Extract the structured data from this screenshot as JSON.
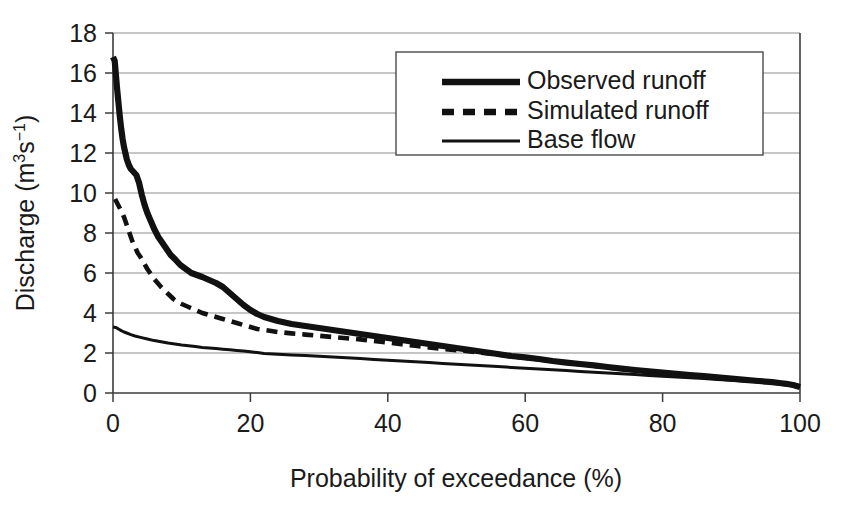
{
  "chart_data": {
    "type": "line",
    "title": "",
    "xlabel": "Probability of exceedance (%)",
    "ylabel_text": "Discharge (m",
    "ylabel_sup1": "3",
    "ylabel_mid": "s",
    "ylabel_sup2": "−1",
    "ylabel_end": ")",
    "ylabel_plain": "Discharge (m3s-1)",
    "xlim": [
      0,
      100
    ],
    "ylim": [
      0,
      18
    ],
    "xticks": [
      0,
      20,
      40,
      60,
      80,
      100
    ],
    "yticks": [
      0,
      2,
      4,
      6,
      8,
      10,
      12,
      14,
      16,
      18
    ],
    "xtick_labels": [
      "0",
      "20",
      "40",
      "60",
      "80",
      "100"
    ],
    "ytick_labels": [
      "0",
      "2",
      "4",
      "6",
      "8",
      "10",
      "12",
      "14",
      "16",
      "18"
    ],
    "grid": "horizontal",
    "legend_position": "top-right",
    "series": [
      {
        "name": "Observed runoff",
        "style": "thick-solid",
        "color": "#111111",
        "x": [
          0.0,
          0.25,
          0.4,
          0.6,
          0.8,
          1.0,
          1.2,
          1.4,
          1.6,
          1.8,
          2.0,
          2.3,
          2.6,
          3.0,
          3.4,
          3.8,
          4.2,
          4.6,
          5.0,
          5.5,
          6.0,
          6.6,
          7.2,
          7.8,
          8.4,
          9.0,
          9.8,
          10.6,
          11.4,
          12.2,
          13.0,
          14.0,
          15.0,
          16.0,
          17.0,
          18.0,
          19.0,
          20.0,
          21.0,
          22.0,
          24.0,
          26.0,
          28.0,
          30.0,
          32.0,
          34.0,
          36.0,
          38.0,
          40.0,
          42.0,
          44.0,
          46.0,
          48.0,
          50.0,
          52.0,
          54.0,
          56.0,
          58.0,
          60.0,
          62.0,
          64.0,
          66.0,
          68.0,
          70.0,
          72.0,
          74.0,
          76.0,
          78.0,
          80.0,
          82.0,
          84.0,
          86.0,
          88.0,
          90.0,
          92.0,
          94.0,
          96.0,
          97.0,
          98.0,
          99.0,
          99.5,
          100.0
        ],
        "y": [
          16.8,
          16.6,
          16.0,
          15.2,
          14.5,
          13.8,
          13.2,
          12.7,
          12.3,
          12.0,
          11.7,
          11.4,
          11.2,
          11.05,
          10.9,
          10.5,
          9.9,
          9.4,
          9.0,
          8.6,
          8.2,
          7.8,
          7.5,
          7.2,
          6.9,
          6.7,
          6.4,
          6.2,
          6.0,
          5.9,
          5.8,
          5.65,
          5.5,
          5.3,
          5.0,
          4.7,
          4.4,
          4.15,
          3.95,
          3.8,
          3.6,
          3.45,
          3.35,
          3.25,
          3.15,
          3.05,
          2.95,
          2.85,
          2.75,
          2.65,
          2.55,
          2.45,
          2.35,
          2.25,
          2.15,
          2.05,
          1.95,
          1.85,
          1.78,
          1.7,
          1.6,
          1.52,
          1.45,
          1.38,
          1.3,
          1.22,
          1.15,
          1.08,
          1.02,
          0.96,
          0.9,
          0.84,
          0.78,
          0.72,
          0.66,
          0.6,
          0.54,
          0.5,
          0.46,
          0.4,
          0.35,
          0.3
        ]
      },
      {
        "name": "Simulated runoff",
        "style": "dashed",
        "color": "#111111",
        "x": [
          0.3,
          0.6,
          0.9,
          1.2,
          1.6,
          2.0,
          2.4,
          2.8,
          3.2,
          3.6,
          4.0,
          4.5,
          5.0,
          5.5,
          6.0,
          6.5,
          7.0,
          7.6,
          8.2,
          8.8,
          9.4,
          10.0,
          11.0,
          12.0,
          13.0,
          14.0,
          15.0,
          16.0,
          17.0,
          18.0,
          19.0,
          20.0,
          21.0,
          22.0,
          24.0,
          26.0,
          28.0,
          30.0,
          32.0,
          34.0,
          36.0,
          38.0,
          40.0,
          42.0,
          44.0,
          46.0,
          48.0,
          50.0,
          52.0,
          54.0,
          56.0,
          58.0,
          60.0,
          62.0,
          64.0,
          66.0,
          68.0,
          70.0,
          72.0,
          74.0,
          76.0,
          78.0,
          80.0,
          82.0,
          84.0,
          86.0,
          88.0,
          90.0,
          92.0,
          94.0,
          96.0,
          97.0,
          98.0,
          99.0,
          99.5,
          100.0
        ],
        "y": [
          9.7,
          9.5,
          9.3,
          9.1,
          8.8,
          8.4,
          8.0,
          7.6,
          7.3,
          7.0,
          6.8,
          6.5,
          6.2,
          5.95,
          5.7,
          5.5,
          5.3,
          5.1,
          4.9,
          4.7,
          4.55,
          4.45,
          4.3,
          4.15,
          4.0,
          3.9,
          3.8,
          3.7,
          3.6,
          3.5,
          3.4,
          3.3,
          3.2,
          3.15,
          3.05,
          2.98,
          2.92,
          2.86,
          2.8,
          2.74,
          2.68,
          2.6,
          2.52,
          2.44,
          2.36,
          2.28,
          2.2,
          2.14,
          2.08,
          2.0,
          1.92,
          1.84,
          1.76,
          1.68,
          1.6,
          1.52,
          1.44,
          1.36,
          1.28,
          1.2,
          1.13,
          1.07,
          1.01,
          0.95,
          0.89,
          0.83,
          0.77,
          0.71,
          0.65,
          0.59,
          0.53,
          0.49,
          0.45,
          0.39,
          0.34,
          0.3
        ]
      },
      {
        "name": "Base flow",
        "style": "thin-solid",
        "color": "#111111",
        "x": [
          0.0,
          0.4,
          0.8,
          1.2,
          1.6,
          2.0,
          2.6,
          3.2,
          4.0,
          5.0,
          6.0,
          7.0,
          8.0,
          9.0,
          10.0,
          11.0,
          12.0,
          13.0,
          14.0,
          15.0,
          16.0,
          17.0,
          18.0,
          19.0,
          20.0,
          21.0,
          22.0,
          24.0,
          26.0,
          28.0,
          30.0,
          32.0,
          34.0,
          36.0,
          38.0,
          40.0,
          42.0,
          44.0,
          46.0,
          48.0,
          50.0,
          52.0,
          54.0,
          56.0,
          58.0,
          60.0,
          62.0,
          64.0,
          66.0,
          68.0,
          70.0,
          72.0,
          74.0,
          76.0,
          78.0,
          80.0,
          82.0,
          84.0,
          86.0,
          88.0,
          90.0,
          92.0,
          94.0,
          96.0,
          97.0,
          98.0,
          99.0,
          99.5,
          100.0
        ],
        "y": [
          3.3,
          3.28,
          3.2,
          3.12,
          3.05,
          3.0,
          2.92,
          2.85,
          2.78,
          2.7,
          2.62,
          2.56,
          2.5,
          2.45,
          2.4,
          2.36,
          2.32,
          2.28,
          2.25,
          2.22,
          2.19,
          2.16,
          2.13,
          2.1,
          2.06,
          2.02,
          1.98,
          1.94,
          1.9,
          1.87,
          1.84,
          1.8,
          1.76,
          1.72,
          1.68,
          1.64,
          1.6,
          1.56,
          1.52,
          1.48,
          1.44,
          1.4,
          1.36,
          1.32,
          1.28,
          1.24,
          1.2,
          1.16,
          1.12,
          1.08,
          1.04,
          1.0,
          0.96,
          0.92,
          0.88,
          0.84,
          0.8,
          0.76,
          0.72,
          0.68,
          0.64,
          0.6,
          0.56,
          0.5,
          0.47,
          0.44,
          0.39,
          0.34,
          0.3
        ]
      }
    ]
  },
  "legend": {
    "items": [
      {
        "label": "Observed runoff"
      },
      {
        "label": "Simulated runoff"
      },
      {
        "label": "Base flow"
      }
    ]
  },
  "colors": {
    "line": "#111111",
    "grid": "#8d8d8d",
    "axis": "#3b3b3b",
    "background": "#ffffff"
  }
}
